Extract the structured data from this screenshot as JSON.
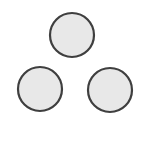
{
  "diagram": {
    "stroke_color": "#3f3f3f",
    "fill_color": "#e8e8e8",
    "background": "#ffffff",
    "circles": [
      {
        "id": "top",
        "cx": 72,
        "cy": 35,
        "r": 22
      },
      {
        "id": "bottom-left",
        "cx": 40,
        "cy": 89,
        "r": 22
      },
      {
        "id": "bottom-right",
        "cx": 110,
        "cy": 90,
        "r": 22
      }
    ]
  }
}
